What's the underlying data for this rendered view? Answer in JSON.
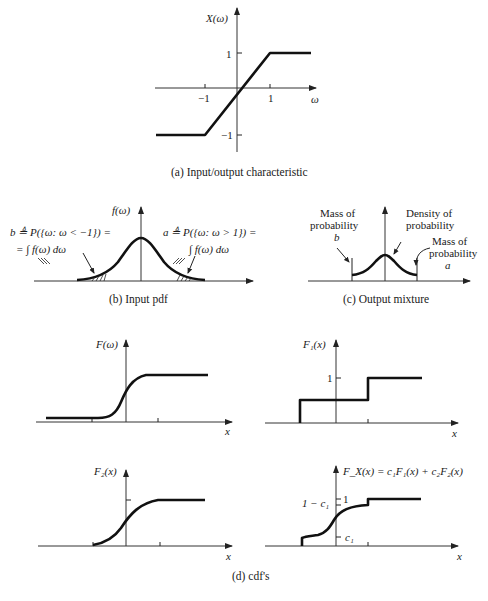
{
  "figure": {
    "panel_a": {
      "caption": "(a)  Input/output characteristic",
      "y_label": "X(ω)",
      "x_label": "ω",
      "ticks": {
        "x_neg": "−1",
        "x_pos": "1",
        "y_pos": "1",
        "y_neg": "−1"
      }
    },
    "panel_b": {
      "caption": "(b)  Input pdf",
      "y_label": "f(ω)",
      "left_annotation_line1": "b ≜ P({ω:  ω < −1}) =",
      "left_annotation_line2": "= ∫ f(ω)  dω",
      "right_annotation_line1": "a ≜ P({ω:  ω > 1}) =",
      "right_annotation_line2": "∫ f(ω)  dω"
    },
    "panel_c": {
      "caption": "(c)  Output mixture",
      "left_label_line1": "Mass of",
      "left_label_line2": "probability",
      "left_label_line3": "b",
      "middle_label_line1": "Density of",
      "middle_label_line2": "probability",
      "right_label_line1": "Mass of",
      "right_label_line2": "probability",
      "right_label_line3": "a"
    },
    "panel_d": {
      "caption": "(d)  cdf's",
      "plots": [
        {
          "y_label": "F(ω)",
          "x_label": "x"
        },
        {
          "y_label": "F₁(x)",
          "x_label": "x",
          "tick_y": "1"
        },
        {
          "y_label": "F₂(x)",
          "x_label": "x"
        },
        {
          "y_label": "F_X(x) = c₁F₁(x) + c₂F₂(x)",
          "x_label": "x",
          "tick_top_left": "1 − c₁",
          "tick_top_right": "1",
          "tick_low": "c₁"
        }
      ]
    }
  }
}
